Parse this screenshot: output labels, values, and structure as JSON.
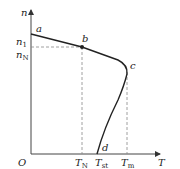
{
  "diagram": {
    "type": "speed-torque characteristic",
    "axes": {
      "y_label": "n",
      "x_label": "T",
      "origin_label": "O"
    },
    "y_ticks": [
      {
        "label_main": "n",
        "label_sub": "1"
      },
      {
        "label_main": "n",
        "label_sub": "N"
      }
    ],
    "x_ticks": [
      {
        "label_main": "T",
        "label_sub": "N"
      },
      {
        "label_main": "T",
        "label_sub": "st"
      },
      {
        "label_main": "T",
        "label_sub": "m"
      }
    ],
    "points": {
      "a": "a",
      "b": "b",
      "c": "c",
      "d": "d"
    },
    "colors": {
      "line": "#222222",
      "dashed": "#888888"
    }
  }
}
